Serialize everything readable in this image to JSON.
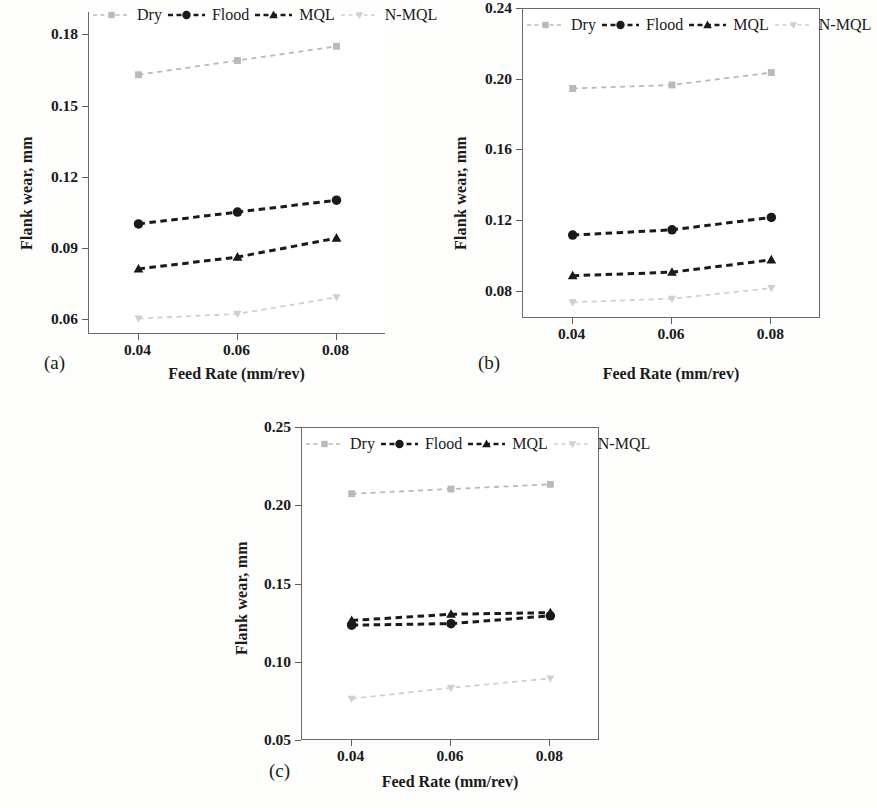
{
  "figure": {
    "panels": [
      "(a)",
      "(b)",
      "(c)"
    ]
  },
  "series_style": {
    "Dry": {
      "color": "#b9b9b9",
      "marker": "square"
    },
    "Flood": {
      "color": "#1a1a1a",
      "marker": "circle"
    },
    "MQL": {
      "color": "#1a1a1a",
      "marker": "triangle"
    },
    "N-MQL": {
      "color": "#cfcfcf",
      "marker": "triangle-down"
    }
  },
  "legend": {
    "entries": [
      "Dry",
      "Flood",
      "MQL",
      "N-MQL"
    ]
  },
  "chart_data": [
    {
      "type": "line",
      "panel": "(a)",
      "title": "",
      "xlabel": "Feed Rate (mm/rev)",
      "ylabel": "Flank wear, mm",
      "x": [
        0.04,
        0.06,
        0.08
      ],
      "xticklabels": [
        "0.04",
        "0.06",
        "0.08"
      ],
      "xlim": [
        0.03,
        0.09
      ],
      "yticks": [
        0.06,
        0.09,
        0.12,
        0.15,
        0.18
      ],
      "yticklabels": [
        "0.06",
        "0.09",
        "0.12",
        "0.15",
        "0.18"
      ],
      "ylim": [
        0.0535,
        0.1895
      ],
      "grid": false,
      "legend_position": "top",
      "series": [
        {
          "name": "Dry",
          "values": [
            0.163,
            0.169,
            0.175
          ]
        },
        {
          "name": "Flood",
          "values": [
            0.1,
            0.105,
            0.11
          ]
        },
        {
          "name": "MQL",
          "values": [
            0.081,
            0.086,
            0.094
          ]
        },
        {
          "name": "N-MQL",
          "values": [
            0.06,
            0.062,
            0.069
          ]
        }
      ]
    },
    {
      "type": "line",
      "panel": "(b)",
      "title": "",
      "xlabel": "Feed Rate (mm/rev)",
      "ylabel": "Flank wear, mm",
      "x": [
        0.04,
        0.06,
        0.08
      ],
      "xticklabels": [
        "0.04",
        "0.06",
        "0.08"
      ],
      "xlim": [
        0.03,
        0.09
      ],
      "yticks": [
        0.08,
        0.12,
        0.16,
        0.2,
        0.24
      ],
      "yticklabels": [
        "0.08",
        "0.12",
        "0.16",
        "0.20",
        "0.24"
      ],
      "ylim": [
        0.0645,
        0.24
      ],
      "grid": false,
      "legend_position": "top",
      "series": [
        {
          "name": "Dry",
          "values": [
            0.195,
            0.197,
            0.204
          ]
        },
        {
          "name": "Flood",
          "values": [
            0.112,
            0.115,
            0.122
          ]
        },
        {
          "name": "MQL",
          "values": [
            0.089,
            0.091,
            0.098
          ]
        },
        {
          "name": "N-MQL",
          "values": [
            0.074,
            0.076,
            0.082
          ]
        }
      ]
    },
    {
      "type": "line",
      "panel": "(c)",
      "title": "",
      "xlabel": "Feed Rate (mm/rev)",
      "ylabel": "Flank wear, mm",
      "x": [
        0.04,
        0.06,
        0.08
      ],
      "xticklabels": [
        "0.04",
        "0.06",
        "0.08"
      ],
      "xlim": [
        0.03,
        0.09
      ],
      "yticks": [
        0.05,
        0.1,
        0.15,
        0.2,
        0.25
      ],
      "yticklabels": [
        "0.05",
        "0.10",
        "0.15",
        "0.20",
        "0.25"
      ],
      "ylim": [
        0.05,
        0.25
      ],
      "grid": false,
      "legend_position": "top",
      "series": [
        {
          "name": "Dry",
          "values": [
            0.208,
            0.211,
            0.214
          ]
        },
        {
          "name": "Flood",
          "values": [
            0.124,
            0.125,
            0.13
          ]
        },
        {
          "name": "MQL",
          "values": [
            0.127,
            0.131,
            0.132
          ]
        },
        {
          "name": "N-MQL",
          "values": [
            0.077,
            0.084,
            0.09
          ]
        }
      ]
    }
  ]
}
